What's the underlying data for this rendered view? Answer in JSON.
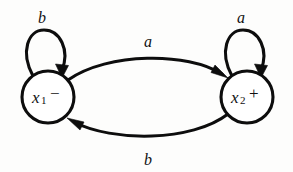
{
  "diagram": {
    "type": "state-transition-diagram",
    "title": "",
    "background_color": "#fdfdfc",
    "stroke_color": "#0d0d0d",
    "states": [
      {
        "id": "x1",
        "label": "x",
        "subscript": "1",
        "marker": "−",
        "cx": 48,
        "cy": 97,
        "r": 26
      },
      {
        "id": "x2",
        "label": "x",
        "subscript": "2",
        "marker": "+",
        "cx": 247,
        "cy": 97,
        "r": 26
      }
    ],
    "transitions": [
      {
        "id": "x1-to-x2",
        "from": "x1",
        "to": "x2",
        "label": "a",
        "label_x": 148,
        "label_y": 42,
        "shape": "arc-top"
      },
      {
        "id": "x2-to-x1",
        "from": "x2",
        "to": "x1",
        "label": "b",
        "label_x": 148,
        "label_y": 160,
        "shape": "arc-bottom"
      },
      {
        "id": "x1-self",
        "from": "x1",
        "to": "x1",
        "label": "b",
        "label_x": 42,
        "label_y": 18,
        "shape": "self-loop"
      },
      {
        "id": "x2-self",
        "from": "x2",
        "to": "x2",
        "label": "a",
        "label_x": 241,
        "label_y": 18,
        "shape": "self-loop"
      }
    ],
    "alphabet": [
      "a",
      "b"
    ],
    "markers": {
      "negative": "−",
      "positive": "+"
    }
  }
}
